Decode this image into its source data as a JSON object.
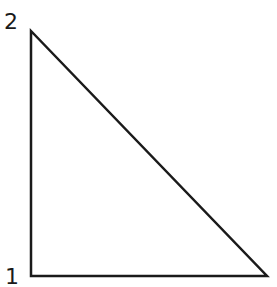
{
  "diagram": {
    "shape": "right-triangle",
    "stroke_color": "#1a1a1a",
    "background": "#ffffff",
    "vertices": [
      {
        "id": "top-left",
        "x": 31,
        "y": 31
      },
      {
        "id": "bottom-left",
        "x": 31,
        "y": 276
      },
      {
        "id": "bottom-right",
        "x": 267,
        "y": 276
      }
    ],
    "labels": {
      "top": "2",
      "bottom": "1"
    }
  }
}
